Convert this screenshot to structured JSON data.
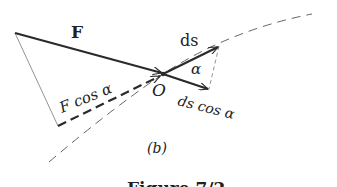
{
  "figure": {
    "panel_label": "(b)",
    "caption": "Figure 7/2",
    "colors": {
      "ink": "#2a2a2a",
      "thin": "#555555",
      "background": "#ffffff"
    }
  },
  "labels": {
    "force": "F",
    "force_component": "F cos α",
    "origin": "O",
    "displacement": "ds",
    "angle": "α",
    "displacement_component": "ds cos α"
  },
  "geometry": {
    "origin": [
      163,
      74
    ],
    "force_tail": [
      15,
      33
    ],
    "ds_head": [
      219,
      46
    ],
    "ds_cos_head": [
      209,
      89
    ],
    "f_cos_tail": [
      58,
      126
    ],
    "path_start": [
      49,
      162
    ],
    "path_end": [
      312,
      14
    ]
  }
}
